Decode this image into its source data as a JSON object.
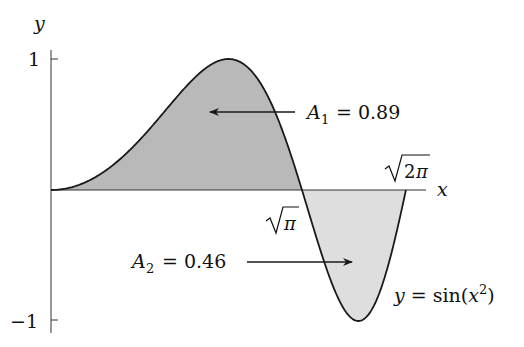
{
  "figure": {
    "function_label": "y = sin(x²)",
    "axes": {
      "x_label": "x",
      "y_label": "y",
      "y_ticks": [
        {
          "value": 1,
          "label": "1"
        },
        {
          "value": -1,
          "label": "−1"
        }
      ],
      "x_marks": [
        {
          "value": 1.7724538509,
          "label": "√π"
        },
        {
          "value": 2.5066282746,
          "label": "√2π"
        }
      ]
    },
    "regions": [
      {
        "name": "A1",
        "label_main": "A",
        "label_sub": "1",
        "label_value": "= 0.89",
        "x_from": 0,
        "x_to": 1.7724538509,
        "fill": "#b9b9b9"
      },
      {
        "name": "A2",
        "label_main": "A",
        "label_sub": "2",
        "label_value": "= 0.46",
        "x_from": 1.7724538509,
        "x_to": 2.5066282746,
        "fill": "#dedede"
      }
    ],
    "colors": {
      "curve": "#1a1a1a",
      "axis": "#333333",
      "region_a1": "#b9b9b9",
      "region_a2": "#dedede"
    }
  },
  "chart_data": {
    "type": "area",
    "title": "",
    "function": "sin(x^2)",
    "xlabel": "x",
    "ylabel": "y",
    "xlim": [
      0,
      2.5066
    ],
    "ylim": [
      -1,
      1
    ],
    "y_ticks": [
      1,
      -1
    ],
    "x_marks": [
      "√π",
      "√2π"
    ],
    "series": [
      {
        "name": "A1",
        "x_range": [
          0,
          1.7725
        ],
        "area": 0.89
      },
      {
        "name": "A2",
        "x_range": [
          1.7725,
          2.5066
        ],
        "area": 0.46
      }
    ],
    "annotations": [
      "A1 = 0.89",
      "A2 = 0.46",
      "y = sin(x^2)"
    ],
    "grid": false
  }
}
